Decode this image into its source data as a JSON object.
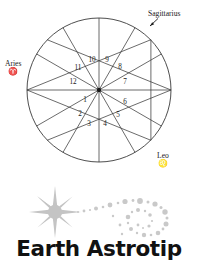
{
  "chart": {
    "houses": [
      {
        "number": "1",
        "angle_deg": 195
      },
      {
        "number": "2",
        "angle_deg": 225
      },
      {
        "number": "3",
        "angle_deg": 255
      },
      {
        "number": "4",
        "angle_deg": 285
      },
      {
        "number": "5",
        "angle_deg": 315
      },
      {
        "number": "6",
        "angle_deg": 345
      },
      {
        "number": "7",
        "angle_deg": 15
      },
      {
        "number": "8",
        "angle_deg": 45
      },
      {
        "number": "9",
        "angle_deg": 75
      },
      {
        "number": "10",
        "angle_deg": 105
      },
      {
        "number": "11",
        "angle_deg": 135
      },
      {
        "number": "12",
        "angle_deg": 165
      }
    ],
    "house_numbers": [
      "1",
      "2",
      "3",
      "4",
      "5",
      "6",
      "7",
      "8",
      "9",
      "10",
      "11",
      "12"
    ],
    "signs": [
      {
        "name": "Aries",
        "glyph": "♈",
        "position": "left"
      },
      {
        "name": "Sagittarius",
        "glyph": "♐",
        "position": "top-right"
      },
      {
        "name": "Leo",
        "glyph": "♌",
        "position": "bottom-right"
      }
    ],
    "colors": {
      "line": "#3a3a3a",
      "text": "#1a1a1a",
      "background": "#ffffff"
    }
  },
  "logo": {
    "wordmark": "Earth Astrotip",
    "sun_icon_name": "sunburst-icon",
    "swirl_icon_name": "dot-spiral-icon",
    "colors": {
      "art": "#c4c4c4",
      "wordmark": "#111111"
    }
  }
}
